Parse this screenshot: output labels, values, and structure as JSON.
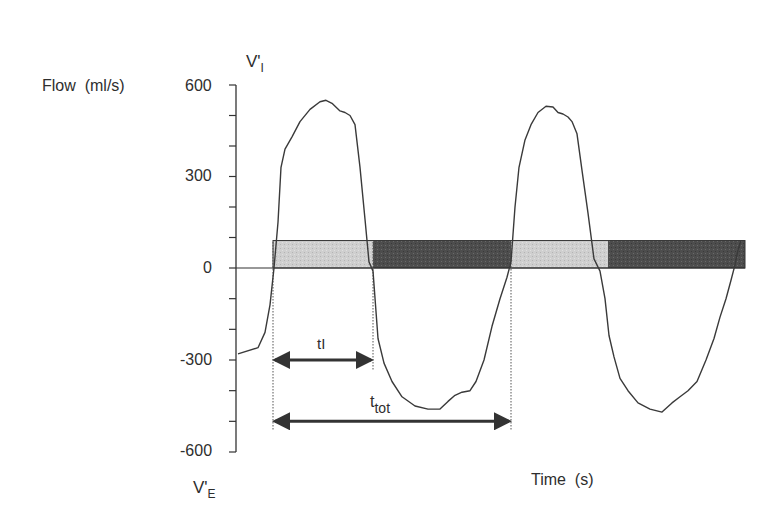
{
  "chart_data": {
    "type": "line",
    "title": "",
    "ylabel": "Flow  (ml/s)",
    "xlabel": "Time  (s)",
    "ylim": [
      -600,
      600
    ],
    "yticks": [
      600,
      300,
      0,
      -300,
      -600
    ],
    "ytick_labels": [
      "600",
      "300",
      "0",
      "-300",
      "-600"
    ],
    "minor_tick_step": 100,
    "grid": false,
    "top_axis_label": {
      "main": "V'",
      "sub": "I"
    },
    "bottom_axis_label": {
      "main": "V'",
      "sub": "E"
    },
    "series": [
      {
        "name": "Airflow",
        "description": "Approximately sinusoidal breathing flow trace, two breaths",
        "x_px": [
          238,
          258,
          265,
          270,
          274,
          278,
          281,
          285,
          292,
          300,
          310,
          320,
          326,
          332,
          340,
          345,
          350,
          355,
          360,
          365,
          369,
          373,
          378,
          384,
          392,
          402,
          415,
          428,
          440,
          448,
          455,
          462,
          470,
          476,
          484,
          492,
          500,
          507,
          511,
          515,
          519,
          525,
          531,
          538,
          546,
          553,
          558,
          563,
          568,
          572,
          577,
          582,
          588,
          594,
          600,
          605,
          609,
          614,
          620,
          628,
          638,
          650,
          662,
          672,
          680,
          688,
          697,
          706,
          714,
          720,
          726,
          731,
          735,
          738,
          741
        ],
        "y_ml_s": [
          -280,
          -260,
          -210,
          -120,
          0,
          150,
          330,
          390,
          430,
          480,
          520,
          545,
          550,
          540,
          515,
          510,
          500,
          470,
          330,
          160,
          20,
          -10,
          -230,
          -310,
          -370,
          -420,
          -450,
          -460,
          -460,
          -435,
          -415,
          -405,
          -400,
          -370,
          -300,
          -190,
          -100,
          -30,
          20,
          200,
          330,
          420,
          470,
          510,
          530,
          528,
          510,
          505,
          495,
          480,
          440,
          320,
          180,
          30,
          -10,
          -100,
          -220,
          -290,
          -360,
          -400,
          -440,
          -460,
          -470,
          -440,
          -420,
          -400,
          -370,
          -300,
          -230,
          -160,
          -100,
          -40,
          10,
          60,
          90
        ]
      }
    ],
    "phase_bar": {
      "y_range_ml_s": [
        0,
        90
      ],
      "segments": [
        {
          "phase": "inspiration",
          "shade": "light",
          "x_px": [
            273,
            373
          ]
        },
        {
          "phase": "expiration",
          "shade": "dark",
          "x_px": [
            373,
            511
          ]
        },
        {
          "phase": "inspiration",
          "shade": "light",
          "x_px": [
            511,
            608
          ]
        },
        {
          "phase": "expiration",
          "shade": "dark",
          "x_px": [
            608,
            745
          ]
        }
      ]
    },
    "annotations": [
      {
        "label": "tI",
        "type": "double-arrow",
        "meaning": "inspiratory time",
        "x_px": [
          273,
          373
        ],
        "y_ml_s": -300
      },
      {
        "label": "t_tot",
        "main": "t",
        "sub": "tot",
        "type": "double-arrow",
        "meaning": "total breath time",
        "x_px": [
          273,
          511
        ],
        "y_ml_s": -500
      }
    ],
    "colors": {
      "line": "#3a3a3a",
      "light_bar": "#c8c8c8",
      "dark_bar": "#4a4a4a",
      "axis": "#333333"
    }
  },
  "labels": {
    "y_axis_title": "Flow  (ml/s)",
    "x_axis_title": "Time  (s)",
    "vi_main": "V'",
    "vi_sub": "I",
    "ve_main": "V'",
    "ve_sub": "E",
    "tick_600": "600",
    "tick_300": "300",
    "tick_0": "0",
    "tick_m300": "-300",
    "tick_m600": "-600",
    "ti_label": "tI",
    "ttot_main": "t",
    "ttot_sub": "tot"
  }
}
